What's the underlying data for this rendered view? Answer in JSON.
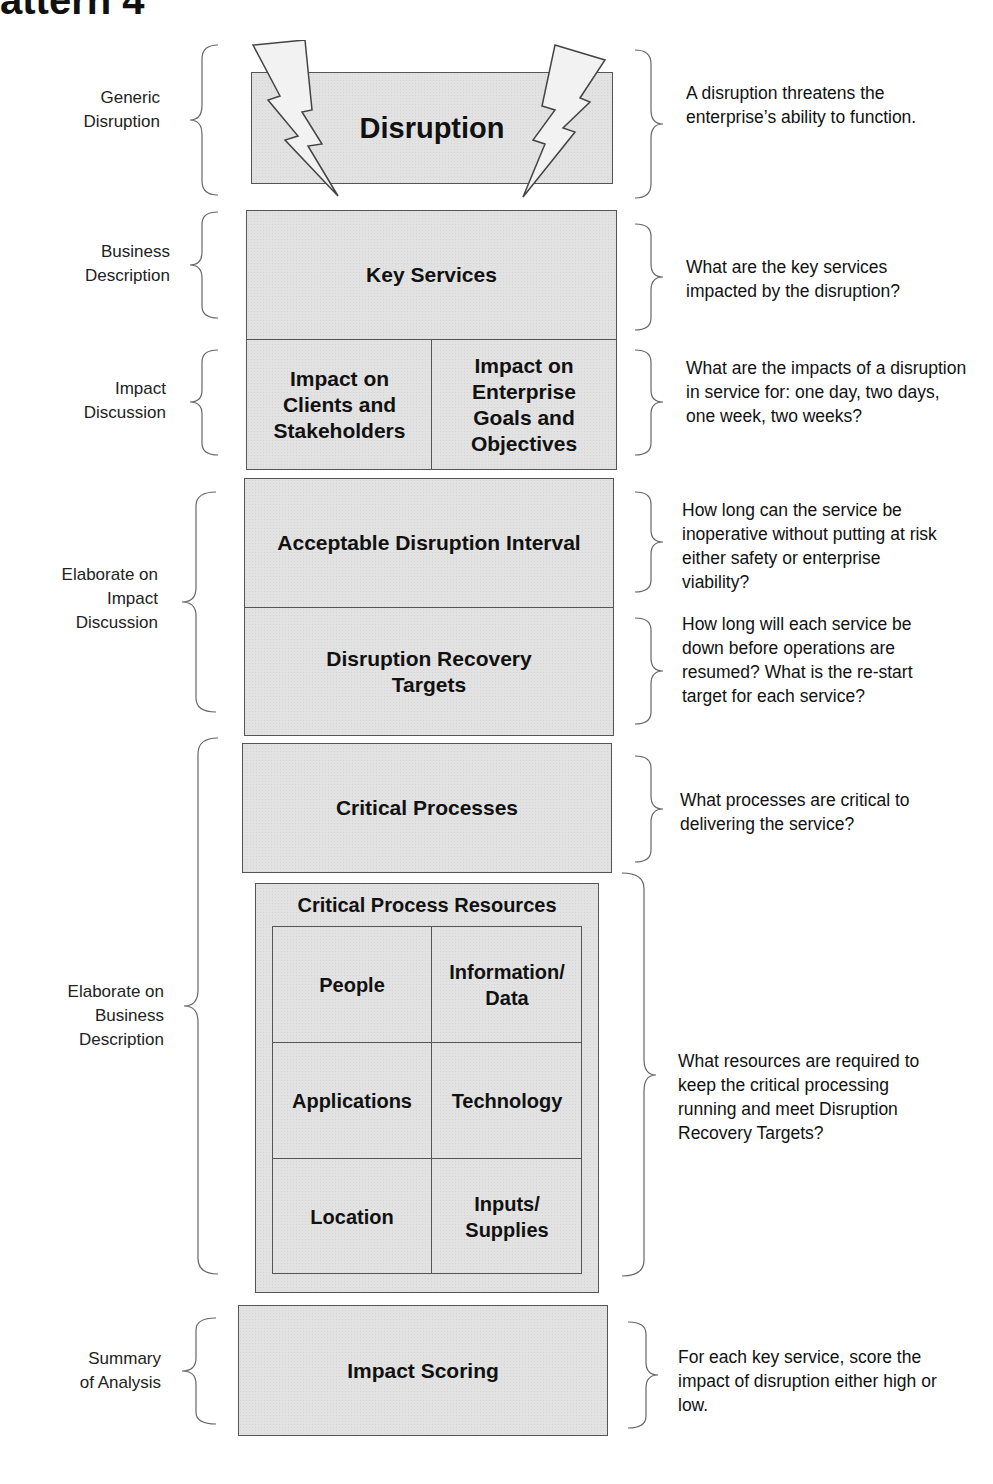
{
  "header": {
    "title_fragment": "attern 4"
  },
  "stages": [
    {
      "left_label": "Generic\nDisruption",
      "box": {
        "label": "Disruption",
        "icons": [
          "lightning-bolt-left",
          "lightning-bolt-right"
        ]
      },
      "right_label": "A disruption threatens the enterprise’s ability to function."
    },
    {
      "left_label": "Business\nDescription",
      "box": {
        "label": "Key Services"
      },
      "right_label": "What are the key services impacted by the disruption?"
    },
    {
      "left_label": "Impact\nDiscussion",
      "box": {
        "cells": [
          "Impact on Clients and Stakeholders",
          "Impact on Enterprise Goals and Objectives"
        ]
      },
      "right_label": "What are the impacts of a disruption in service for: one day, two days, one week, two weeks?"
    },
    {
      "left_label": "Elaborate on\nImpact\nDiscussion",
      "boxes": [
        {
          "label": "Acceptable Disruption Interval",
          "right_label": "How long can the service be inoperative without putting at risk either safety or enterprise viability?"
        },
        {
          "label": "Disruption Recovery Targets",
          "right_label": "How long will each service be down before operations are resumed? What is the re-start target for each service?"
        }
      ]
    },
    {
      "left_label": "Elaborate on\nBusiness\nDescription",
      "boxes": [
        {
          "label": "Critical Processes",
          "right_label": "What processes are critical to delivering the service?"
        },
        {
          "label": "Critical Process Resources",
          "cells": [
            "People",
            "Information/ Data",
            "Applications",
            "Technology",
            "Location",
            "Inputs/ Supplies"
          ],
          "right_label": "What resources are required to keep the critical processing running and meet Disruption Recovery Targets?"
        }
      ]
    },
    {
      "left_label": "Summary\nof Analysis",
      "box": {
        "label": "Impact Scoring"
      },
      "right_label": "For each key service, score the impact of disruption either high or low."
    }
  ],
  "colors": {
    "box_fill": "#e2e2e2",
    "box_border": "#555555",
    "bolt_fill": "#f2f2f2",
    "brace": "#666666",
    "text": "#111111"
  }
}
